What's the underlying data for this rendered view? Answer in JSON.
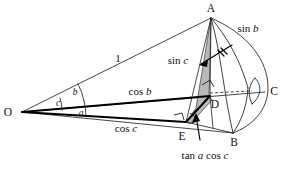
{
  "figure": {
    "name": "spherical-trigonometry-cone-diagram",
    "background_color": "#ffffff",
    "line_color": "#111111",
    "shade_color": "#b9b9b9"
  },
  "vertices": {
    "O": "O",
    "A": "A",
    "B": "B",
    "C": "C",
    "D": "D",
    "E": "E"
  },
  "angles": {
    "a": "a",
    "b": "b",
    "c": "c"
  },
  "edge_labels": {
    "unit": "1",
    "sin_c": "sin c",
    "sin_b": "sin b",
    "cos_b": "cos b",
    "cos_c": "cos c",
    "tan_a_cos_c": "tan a cos c"
  },
  "segments": {
    "sin_c_italic": "c",
    "sin_c_prefix": "sin ",
    "sin_b_italic": "b",
    "sin_b_prefix": "sin ",
    "cos_b_italic": "b",
    "cos_b_prefix": "cos ",
    "cos_c_italic": "c",
    "cos_c_prefix": "cos ",
    "tan_prefix": "tan ",
    "tan_a_italic": "a",
    "tan_cos_mid": " cos ",
    "tan_c_italic": "c"
  }
}
